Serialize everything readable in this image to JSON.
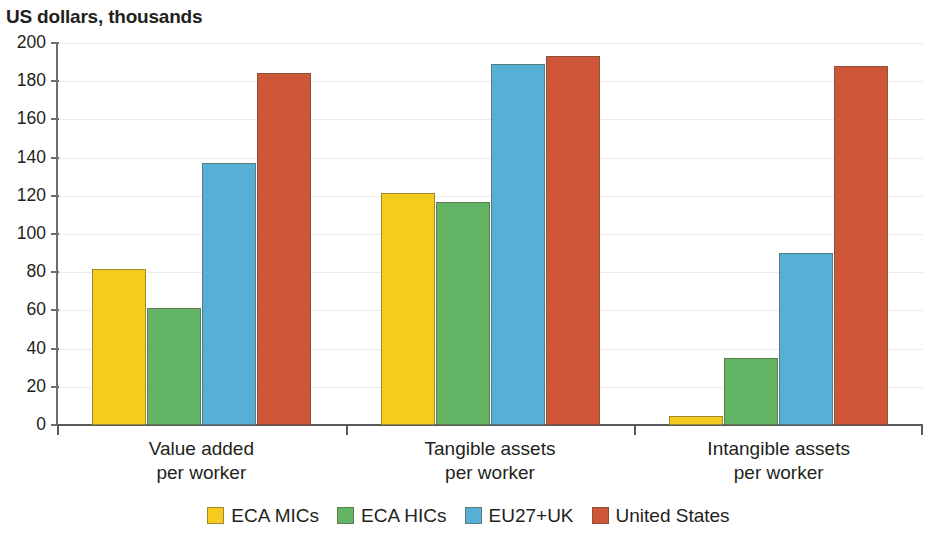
{
  "chart_data": {
    "type": "bar",
    "title": "US dollars, thousands",
    "xlabel": "",
    "ylabel": "US dollars, thousands",
    "ylim": [
      0,
      200
    ],
    "yticks": [
      0,
      20,
      40,
      60,
      80,
      100,
      120,
      140,
      160,
      180,
      200
    ],
    "ytick_labels": [
      "0",
      "20",
      "40",
      "60",
      "80",
      "100",
      "120",
      "140",
      "160",
      "180",
      "200"
    ],
    "grid": true,
    "legend_position": "bottom",
    "categories": [
      "Value added\nper worker",
      "Tangible assets\nper worker",
      "Intangible assets\nper worker"
    ],
    "category_lines": [
      [
        "Value added",
        "per worker"
      ],
      [
        "Tangible assets",
        "per worker"
      ],
      [
        "Intangible assets",
        "per worker"
      ]
    ],
    "series": [
      {
        "name": "ECA MICs",
        "color": "#F5CC1E",
        "values": [
          81.5,
          121.5,
          4.5
        ]
      },
      {
        "name": "ECA HICs",
        "color": "#63B464",
        "values": [
          61.5,
          117.0,
          35.0
        ]
      },
      {
        "name": "EU27+UK",
        "color": "#56AFD4",
        "values": [
          137.0,
          189.0,
          90.0
        ]
      },
      {
        "name": "United States",
        "color": "#CC5637",
        "values": [
          184.5,
          193.0,
          188.0
        ]
      }
    ]
  },
  "legend": {
    "items": [
      {
        "label": "ECA MICs",
        "color": "#F5CC1E"
      },
      {
        "label": "ECA HICs",
        "color": "#63B464"
      },
      {
        "label": "EU27+UK",
        "color": "#56AFD4"
      },
      {
        "label": "United States",
        "color": "#CC5637"
      }
    ]
  }
}
